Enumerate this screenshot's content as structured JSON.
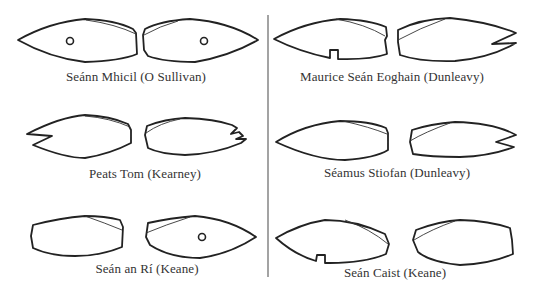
{
  "figure": {
    "panels": [
      {
        "caption": "Seánn Mhicil (O Sullivan)",
        "left_ear": "pointed tip, hole",
        "right_ear": "pointed tip, hole"
      },
      {
        "caption": "Maurice Seán Eoghain (Dunleavy)",
        "left_ear": "pointed tip, square notch underneath",
        "right_ear": "swallow-tail (V notch) at tip"
      },
      {
        "caption": "Peats Tom (Kearney)",
        "left_ear": "swallow-tail (V notch) at tip",
        "right_ear": "double notch (W cut) at tip"
      },
      {
        "caption": "Séamus Stiofan (Dunleavy)",
        "left_ear": "pointed tip, plain",
        "right_ear": "swallow-tail (V notch) at tip"
      },
      {
        "caption": "Seán an Rí (Keane)",
        "left_ear": "cropped (blunt) tip",
        "right_ear": "pointed tip, hole"
      },
      {
        "caption": "Seán Caist (Keane)",
        "left_ear": "pointed tip, square notch underneath",
        "right_ear": "cropped (blunt) tip"
      }
    ],
    "colors": {
      "line": "#222222",
      "background": "#ffffff",
      "divider": "#666666",
      "text": "#333333"
    }
  }
}
